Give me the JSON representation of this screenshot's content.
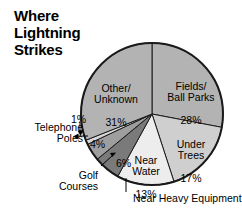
{
  "chart_data": {
    "type": "pie",
    "title": "Where Lightning Strikes",
    "xlabel": "",
    "ylabel": "",
    "legend_position": "none",
    "grid": false,
    "categories": [
      "Fields/Ball Parks",
      "Under Trees",
      "Near Water",
      "Near Heavy Equipment",
      "Golf Courses",
      "Telephone Poles",
      "Other/Unknown"
    ],
    "values": [
      28,
      17,
      13,
      6,
      4,
      1,
      31
    ],
    "units": "percent",
    "total": 100,
    "slices": [
      {
        "name": "Fields/Ball Parks",
        "label": "Fields/\nBall Parks",
        "value": 28,
        "value_text": "28%",
        "color": "#b3b3b3",
        "label_placement": "inside"
      },
      {
        "name": "Under Trees",
        "label": "Under\nTrees",
        "value": 17,
        "value_text": "17%",
        "color": "#cfcfcf",
        "label_placement": "inside"
      },
      {
        "name": "Near Water",
        "label": "Near\nWater",
        "value": 13,
        "value_text": "13%",
        "color": "#ededed",
        "label_placement": "inside"
      },
      {
        "name": "Near Heavy Equipment",
        "label": "Near Heavy Equipment",
        "value": 6,
        "value_text": "6%",
        "color": "#7a7a7a",
        "label_placement": "callout"
      },
      {
        "name": "Golf Courses",
        "label": "Golf\nCourses",
        "value": 4,
        "value_text": "4%",
        "color": "#9e9e9e",
        "label_placement": "callout"
      },
      {
        "name": "Telephone Poles",
        "label": "Telephone\nPoles",
        "value": 1,
        "value_text": "1%",
        "color": "#d8d8d8",
        "label_placement": "callout"
      },
      {
        "name": "Other/Unknown",
        "label": "Other/\nUnknown",
        "value": 31,
        "value_text": "31%",
        "color": "#b3b3b3",
        "label_placement": "inside"
      }
    ]
  },
  "geometry": {
    "center_x": 152,
    "center_y": 114,
    "radius": 71,
    "start_angle_deg": -90,
    "stroke": "#1a1a1a",
    "stroke_width": 1
  },
  "background": "#ffffff"
}
